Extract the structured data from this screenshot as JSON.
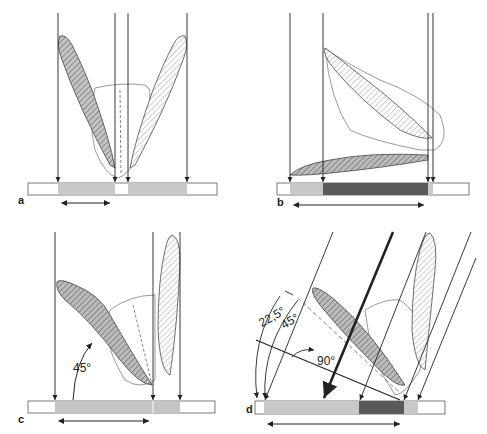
{
  "figure": {
    "panels": [
      {
        "id": "a",
        "label": "a",
        "description": "Two teeth diverging, parallel vertical beams, two equal film projections"
      },
      {
        "id": "b",
        "label": "b",
        "description": "Tooth lying horizontally, overlapping projection (dark region)"
      },
      {
        "id": "c",
        "label": "c",
        "description": "Tooth tilted at 45 degrees, vertical beams",
        "angle_label": "45°"
      },
      {
        "id": "d",
        "label": "d",
        "description": "Oblique beams, bisecting angle geometry",
        "angle_labels": [
          "22,5°",
          "45°",
          "90°"
        ]
      }
    ],
    "colors": {
      "line": "#222222",
      "film_light": "#c8c8c8",
      "film_mid": "#b4b4b4",
      "film_dark": "#5a5a5a",
      "film_bg": "#ffffff",
      "tooth_shade": "#bdbdbd"
    }
  }
}
